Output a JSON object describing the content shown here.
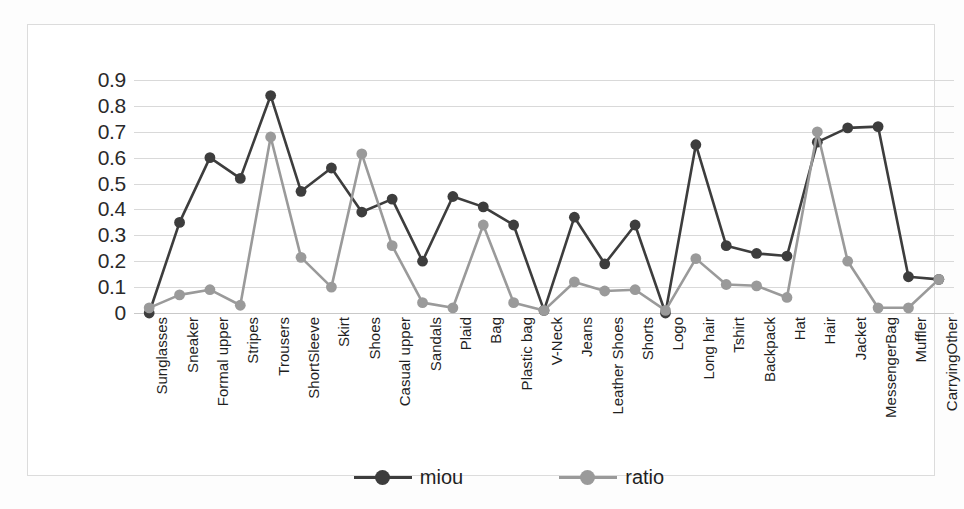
{
  "chart_data": {
    "type": "line",
    "title": "",
    "xlabel": "",
    "ylabel": "",
    "ylim": [
      0,
      0.9
    ],
    "grid": true,
    "legend_position": "bottom",
    "y_ticks": [
      "0",
      "0.1",
      "0.2",
      "0.3",
      "0.4",
      "0.5",
      "0.6",
      "0.7",
      "0.8",
      "0.9"
    ],
    "categories": [
      "Sunglasses",
      "Sneaker",
      "Formal upper",
      "Stripes",
      "Trousers",
      "ShortSleeve",
      "Skirt",
      "Shoes",
      "Casual upper",
      "Sandals",
      "Plaid",
      "Bag",
      "Plastic bag",
      "V-Neck",
      "Jeans",
      "Leather Shoes",
      "Shorts",
      "Logo",
      "Long hair",
      "Tshirt",
      "Backpack",
      "Hat",
      "Hair",
      "Jacket",
      "MessengerBag",
      "Muffler",
      "CarryingOther"
    ],
    "series": [
      {
        "name": "miou",
        "color": "#3d3d3d",
        "values": [
          0.0,
          0.35,
          0.6,
          0.52,
          0.84,
          0.47,
          0.56,
          0.39,
          0.44,
          0.2,
          0.45,
          0.41,
          0.34,
          0.01,
          0.37,
          0.19,
          0.34,
          0.0,
          0.65,
          0.26,
          0.23,
          0.22,
          0.66,
          0.715,
          0.72,
          0.14,
          0.13
        ]
      },
      {
        "name": "ratio",
        "color": "#9a9a9a",
        "values": [
          0.02,
          0.07,
          0.09,
          0.03,
          0.68,
          0.215,
          0.1,
          0.615,
          0.26,
          0.04,
          0.02,
          0.34,
          0.04,
          0.01,
          0.12,
          0.085,
          0.09,
          0.01,
          0.21,
          0.11,
          0.105,
          0.06,
          0.7,
          0.2,
          0.02,
          0.02,
          0.13
        ]
      }
    ]
  },
  "legend": {
    "entries": [
      {
        "label": "miou"
      },
      {
        "label": "ratio"
      }
    ]
  },
  "colors": {
    "miou": "#3d3d3d",
    "ratio": "#9a9a9a",
    "gridline": "#d9d9d9",
    "frame": "#dcdcdc",
    "background": "#ffffff"
  }
}
